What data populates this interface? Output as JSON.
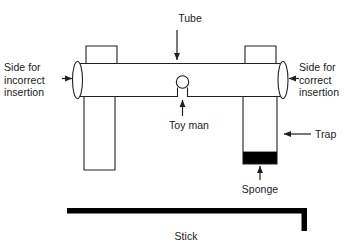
{
  "figure": {
    "background_color": "#ffffff",
    "line_color": "#231f20",
    "fill_color": "#ffffff",
    "solid_color": "#000000",
    "text_color": "#1a1a1a"
  },
  "labels": {
    "tube": "Tube",
    "side_incorrect": "Side for\nincorrect\ninsertion",
    "side_correct": "Side for\ncorrect\ninsertion",
    "toy_man": "Toy man",
    "trap": "Trap",
    "sponge": "Sponge",
    "stick": "Stick"
  },
  "parts": {
    "horizontal_tube": "horizontal-tube",
    "left_opening_ellipse": "left-tube-opening",
    "right_opening_ellipse": "right-tube-opening",
    "left_top_collar": "left-top-collar",
    "right_top_collar": "right-top-collar",
    "left_vertical_shaft": "left-vertical-shaft",
    "trap_shaft": "trap-shaft",
    "sponge_block": "sponge-block",
    "toy_man_head": "toy-man-head",
    "toy_man_body": "toy-man-body",
    "stick_horizontal": "stick-horizontal-bar",
    "stick_vertical": "stick-vertical-end"
  },
  "pointers": {
    "tube": "arrow-down-to-tube",
    "side_incorrect": "arrow-right-to-left-opening",
    "side_correct": "arrow-left-to-right-opening",
    "toy_man": "arrow-up-to-toy-man",
    "trap": "arrow-left-to-trap",
    "sponge": "arrow-up-to-sponge"
  }
}
